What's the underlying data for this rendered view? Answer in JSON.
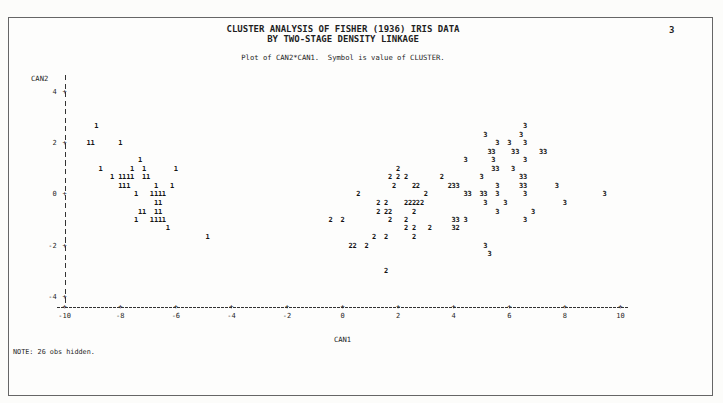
{
  "page": {
    "titles": [
      "CLUSTER ANALYSIS OF FISHER (1936) IRIS DATA",
      "BY TWO-STAGE DENSITY LINKAGE"
    ],
    "page_number": "3",
    "subtitle": "Plot of CAN2*CAN1.  Symbol is value of CLUSTER.",
    "note": "NOTE: 26 obs hidden.",
    "text_color": "#1f1f1f",
    "background_color": "#fdfdfc",
    "border_color": "#666666"
  },
  "chart_data": {
    "type": "scatter",
    "title": "CLUSTER ANALYSIS OF FISHER (1936) IRIS DATA BY TWO-STAGE DENSITY LINKAGE",
    "subtitle": "Plot of CAN2*CAN1.  Symbol is value of CLUSTER.",
    "xlabel": "CAN1",
    "ylabel": "CAN2",
    "xlim": [
      -10,
      10
    ],
    "ylim": [
      -4,
      4
    ],
    "xticks": [
      -10,
      -8,
      -6,
      -4,
      -2,
      0,
      2,
      4,
      6,
      8,
      10
    ],
    "yticks": [
      4,
      2,
      0,
      -2,
      -4
    ],
    "grid": false,
    "marker_style": "text symbol equals cluster number",
    "annotation": "NOTE: 26 obs hidden.",
    "series": [
      {
        "name": "CLUSTER 1",
        "symbol": "1",
        "points": [
          [
            -8.86,
            2.67
          ],
          [
            -9.14,
            2
          ],
          [
            -9,
            2
          ],
          [
            -8,
            2
          ],
          [
            -7.29,
            1.33
          ],
          [
            -8.71,
            1
          ],
          [
            -7.57,
            1
          ],
          [
            -7.14,
            1
          ],
          [
            -6,
            1
          ],
          [
            -8.29,
            0.67
          ],
          [
            -8,
            0.67
          ],
          [
            -7.86,
            0.67
          ],
          [
            -7.71,
            0.67
          ],
          [
            -7.57,
            0.67
          ],
          [
            -7.14,
            0.67
          ],
          [
            -7,
            0.67
          ],
          [
            -8,
            0.33
          ],
          [
            -7.86,
            0.33
          ],
          [
            -7.71,
            0.33
          ],
          [
            -6.71,
            0.33
          ],
          [
            -6.14,
            0.33
          ],
          [
            -7.43,
            0
          ],
          [
            -6.86,
            0
          ],
          [
            -6.71,
            0
          ],
          [
            -6.57,
            0
          ],
          [
            -6.43,
            0
          ],
          [
            -6.71,
            -0.33
          ],
          [
            -6.57,
            -0.33
          ],
          [
            -7.29,
            -0.67
          ],
          [
            -7.14,
            -0.67
          ],
          [
            -6.71,
            -0.67
          ],
          [
            -6.57,
            -0.67
          ],
          [
            -7.43,
            -1
          ],
          [
            -6.86,
            -1
          ],
          [
            -6.71,
            -1
          ],
          [
            -6.57,
            -1
          ],
          [
            -6.43,
            -1
          ],
          [
            -6.29,
            -1.33
          ],
          [
            -4.86,
            -1.67
          ]
        ]
      },
      {
        "name": "CLUSTER 2",
        "symbol": "2",
        "points": [
          [
            2,
            1
          ],
          [
            1.71,
            0.67
          ],
          [
            2,
            0.67
          ],
          [
            2.29,
            0.67
          ],
          [
            3.57,
            0.67
          ],
          [
            1.86,
            0.33
          ],
          [
            2.57,
            0.33
          ],
          [
            2.71,
            0.33
          ],
          [
            3.86,
            0.33
          ],
          [
            0.57,
            0
          ],
          [
            3,
            0
          ],
          [
            1.29,
            -0.33
          ],
          [
            1.57,
            -0.33
          ],
          [
            2.29,
            -0.33
          ],
          [
            2.43,
            -0.33
          ],
          [
            2.57,
            -0.33
          ],
          [
            2.71,
            -0.33
          ],
          [
            2.86,
            -0.33
          ],
          [
            1.29,
            -0.67
          ],
          [
            1.57,
            -0.67
          ],
          [
            1.71,
            -0.67
          ],
          [
            2.57,
            -0.67
          ],
          [
            -0.43,
            -1
          ],
          [
            0,
            -1
          ],
          [
            1.71,
            -1
          ],
          [
            2.29,
            -1
          ],
          [
            2.29,
            -1.33
          ],
          [
            2.57,
            -1.33
          ],
          [
            3.14,
            -1.33
          ],
          [
            4.14,
            -1.33
          ],
          [
            1.14,
            -1.67
          ],
          [
            1.57,
            -1.67
          ],
          [
            2.57,
            -1.67
          ],
          [
            0.29,
            -2
          ],
          [
            0.43,
            -2
          ],
          [
            0.86,
            -2
          ],
          [
            1.57,
            -3
          ]
        ]
      },
      {
        "name": "CLUSTER 3",
        "symbol": "3",
        "points": [
          [
            6.57,
            2.67
          ],
          [
            5.14,
            2.33
          ],
          [
            6.43,
            2.33
          ],
          [
            5.57,
            2
          ],
          [
            6,
            2
          ],
          [
            6.57,
            2
          ],
          [
            5.29,
            1.67
          ],
          [
            5.43,
            1.67
          ],
          [
            6.14,
            1.67
          ],
          [
            6.29,
            1.67
          ],
          [
            7.14,
            1.67
          ],
          [
            7.29,
            1.67
          ],
          [
            4.43,
            1.33
          ],
          [
            5.43,
            1.33
          ],
          [
            6.57,
            1.33
          ],
          [
            5.43,
            1
          ],
          [
            5.57,
            1
          ],
          [
            6.14,
            1
          ],
          [
            5,
            0.67
          ],
          [
            6.43,
            0.67
          ],
          [
            6.57,
            0.67
          ],
          [
            4,
            0.33
          ],
          [
            4.14,
            0.33
          ],
          [
            5.57,
            0.33
          ],
          [
            6.43,
            0.33
          ],
          [
            6.57,
            0.33
          ],
          [
            7.71,
            0.33
          ],
          [
            4.43,
            0
          ],
          [
            4.57,
            0
          ],
          [
            5,
            0
          ],
          [
            5.14,
            0
          ],
          [
            5.57,
            0
          ],
          [
            6.57,
            0
          ],
          [
            9.43,
            0
          ],
          [
            5.14,
            -0.33
          ],
          [
            5.86,
            -0.33
          ],
          [
            8,
            -0.33
          ],
          [
            5.57,
            -0.67
          ],
          [
            6.86,
            -0.67
          ],
          [
            4,
            -1
          ],
          [
            4.14,
            -1
          ],
          [
            4.43,
            -1
          ],
          [
            6.57,
            -1
          ],
          [
            4,
            -1.33
          ],
          [
            5.14,
            -2
          ],
          [
            5.29,
            -2.33
          ]
        ]
      }
    ]
  }
}
